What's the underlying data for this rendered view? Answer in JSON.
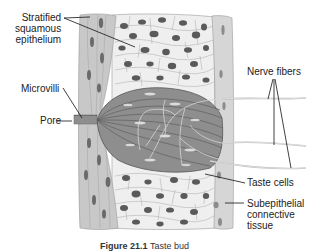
{
  "figure": {
    "title": "Taste bud",
    "caption_prefix": "Figure 21.1",
    "caption_text": "Taste bud",
    "colors": {
      "background": "#ffffff",
      "epithelium_band": "#c8c8c8",
      "squamous_cells": "#ececec",
      "taste_bud": "#8a8a8a",
      "nuclei": "#5a5a5a",
      "connective_tissue": "#d4d4d4",
      "leader_lines": "#111111",
      "nerve_fibers": "#bdbdbd"
    }
  },
  "labels": {
    "stratified_line1": "Stratified",
    "stratified_line2": "squamous",
    "stratified_line3": "epithelium",
    "microvilli": "Microvilli",
    "pore": "Pore",
    "nerve_fibers": "Nerve fibers",
    "taste_cells": "Taste cells",
    "subepithelial_line1": "Subepithelial",
    "subepithelial_line2": "connective",
    "subepithelial_line3": "tissue"
  }
}
